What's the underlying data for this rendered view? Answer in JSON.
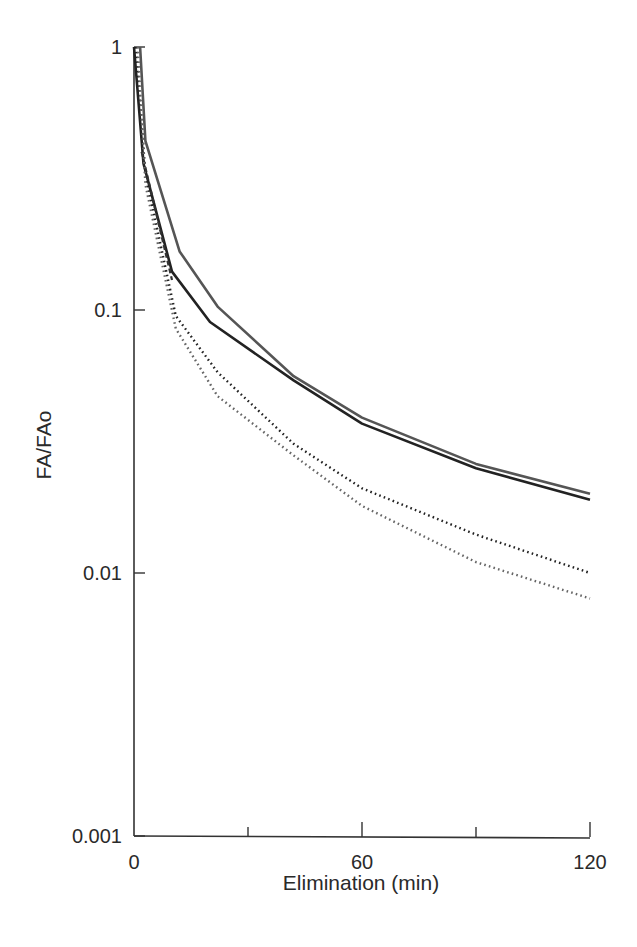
{
  "chart_data": {
    "type": "line",
    "title": "",
    "xlabel": "Elimination (min)",
    "ylabel": "FA/FAo",
    "xlim": [
      0,
      120
    ],
    "ylim": [
      0.001,
      1
    ],
    "yscale": "log",
    "grid": false,
    "legend": null,
    "x_ticks": [
      0,
      30,
      60,
      90,
      120
    ],
    "x_tick_labels": [
      "0",
      "",
      "60",
      "",
      "120"
    ],
    "y_ticks": [
      1,
      0.1,
      0.01,
      0.001
    ],
    "y_tick_labels": [
      "1",
      "0.1",
      "0.01",
      "0.001"
    ],
    "series": [
      {
        "name": "solid-gray",
        "style": "solid",
        "color": "#555555",
        "points": [
          [
            1.6,
            1.0
          ],
          [
            3,
            0.44
          ],
          [
            12,
            0.167
          ],
          [
            22,
            0.103
          ],
          [
            42,
            0.056
          ],
          [
            60,
            0.039
          ],
          [
            90,
            0.026
          ],
          [
            120,
            0.02
          ]
        ]
      },
      {
        "name": "solid-black",
        "style": "solid",
        "color": "#222222",
        "points": [
          [
            0,
            1.0
          ],
          [
            2.5,
            0.36
          ],
          [
            10,
            0.14
          ],
          [
            20,
            0.09
          ],
          [
            42,
            0.054
          ],
          [
            60,
            0.037
          ],
          [
            90,
            0.025
          ],
          [
            120,
            0.019
          ]
        ]
      },
      {
        "name": "dashed",
        "style": "dashed",
        "color": "#333333",
        "points": [
          [
            2,
            0.4
          ],
          [
            10,
            0.13
          ]
        ]
      },
      {
        "name": "dotted-dark",
        "style": "dotted",
        "color": "#222222",
        "points": [
          [
            0.5,
            1.0
          ],
          [
            3,
            0.33
          ],
          [
            11,
            0.095
          ],
          [
            22,
            0.058
          ],
          [
            42,
            0.031
          ],
          [
            60,
            0.021
          ],
          [
            90,
            0.014
          ],
          [
            120,
            0.01
          ]
        ]
      },
      {
        "name": "dotted-gray",
        "style": "dotted",
        "color": "#666666",
        "points": [
          [
            1,
            1.0
          ],
          [
            3,
            0.3
          ],
          [
            11,
            0.085
          ],
          [
            22,
            0.047
          ],
          [
            42,
            0.028
          ],
          [
            60,
            0.018
          ],
          [
            90,
            0.011
          ],
          [
            120,
            0.008
          ]
        ]
      }
    ]
  },
  "layout": {
    "plot_left": 134,
    "plot_right": 590,
    "y_top": 47,
    "decade_px": 263
  }
}
